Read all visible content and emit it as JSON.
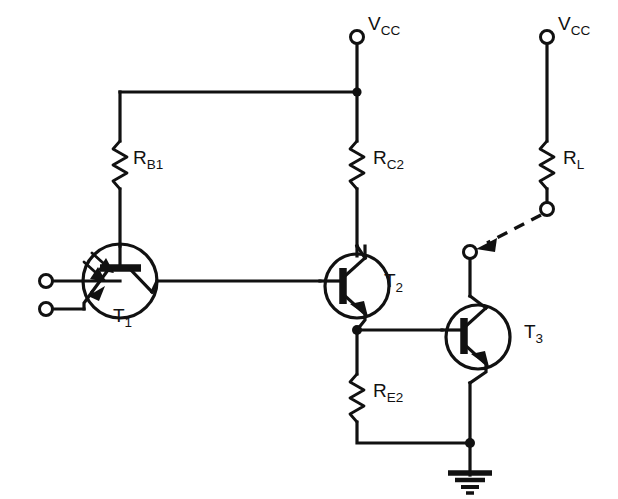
{
  "diagram": {
    "type": "electronic-schematic",
    "background_color": "#ffffff",
    "line_color": "#111111"
  },
  "supply_terminals": [
    {
      "id": "vcc-left",
      "base": "V",
      "sub": "CC",
      "x": 357,
      "y": 37
    },
    {
      "id": "vcc-right",
      "base": "V",
      "sub": "CC",
      "x": 547,
      "y": 37
    }
  ],
  "resistors": [
    {
      "id": "rb1",
      "base": "R",
      "sub": "B1",
      "label_x": 133,
      "label_y": 164
    },
    {
      "id": "rc2",
      "base": "R",
      "sub": "C2",
      "label_x": 373,
      "label_y": 164
    },
    {
      "id": "rl",
      "base": "R",
      "sub": "L",
      "label_x": 563,
      "label_y": 164
    },
    {
      "id": "re2",
      "base": "R",
      "sub": "E2",
      "label_x": 373,
      "label_y": 397
    }
  ],
  "transistors": [
    {
      "id": "t1",
      "base": "T",
      "sub": "1",
      "kind": "phototransistor-npn",
      "label_x": 113,
      "label_y": 322
    },
    {
      "id": "t2",
      "base": "T",
      "sub": "2",
      "kind": "npn",
      "label_x": 384,
      "label_y": 287
    },
    {
      "id": "t3",
      "base": "T",
      "sub": "3",
      "kind": "npn",
      "label_x": 524,
      "label_y": 338
    }
  ],
  "input_terminals": [
    {
      "id": "input-top",
      "x": 46,
      "y": 281
    },
    {
      "id": "input-bottom",
      "x": 46,
      "y": 309
    }
  ],
  "optical_terminals": [
    {
      "id": "lamp-terminal-top",
      "x": 547,
      "y": 209
    },
    {
      "id": "lamp-terminal-bottom",
      "x": 470,
      "y": 252
    }
  ],
  "optical_link": {
    "id": "light-ray",
    "style": "dashed-arrow",
    "from_x": 541,
    "from_y": 215,
    "to_x": 476,
    "to_y": 248
  },
  "ground": {
    "id": "ground-symbol",
    "x": 470,
    "y": 443
  }
}
